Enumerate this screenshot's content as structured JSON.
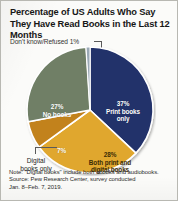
{
  "title": "Percentage of US Adults Who Say They Have Read Books in the Last 12 Months",
  "callout": "Don't know/Refused 1%",
  "footnote": {
    "line1": "Note: \"Digital books\" include both ebooks and audiobooks.",
    "line2": "Source: Pew Research Center, survey conducted",
    "line3": "Jan. 8–Feb. 7, 2019."
  },
  "labels": {
    "print_pct": "37%",
    "print_name_1": "Print books",
    "print_name_2": "only",
    "nobooks_pct": "27%",
    "nobooks_name": "No books",
    "both_pct": "28%",
    "both_name_1": "Both print and",
    "both_name_2": "digital books",
    "digital_pct": "7%",
    "digital_name_1": "Digital",
    "digital_name_2": "books only"
  },
  "chart_data": {
    "type": "pie",
    "title": "Percentage of US Adults Who Say They Have Read Books in the Last 12 Months",
    "categories": [
      "Print books only",
      "Both print and digital books",
      "Digital books only",
      "No books",
      "Don't know/Refused"
    ],
    "values": [
      37,
      28,
      7,
      27,
      1
    ],
    "value_labels": [
      "37%",
      "28%",
      "7%",
      "27%",
      "1%"
    ],
    "colors": [
      "#21306b",
      "#e0a72e",
      "#c2821d",
      "#6f7f66",
      "#9aa8b5"
    ],
    "units": "percent",
    "legend": "none",
    "annotations": [
      "Don't know/Refused 1%",
      "Digital books only"
    ],
    "note": "Note: \"Digital books\" include both ebooks and audiobooks.",
    "source": "Source: Pew Research Center, survey conducted Jan. 8–Feb. 7, 2019."
  }
}
